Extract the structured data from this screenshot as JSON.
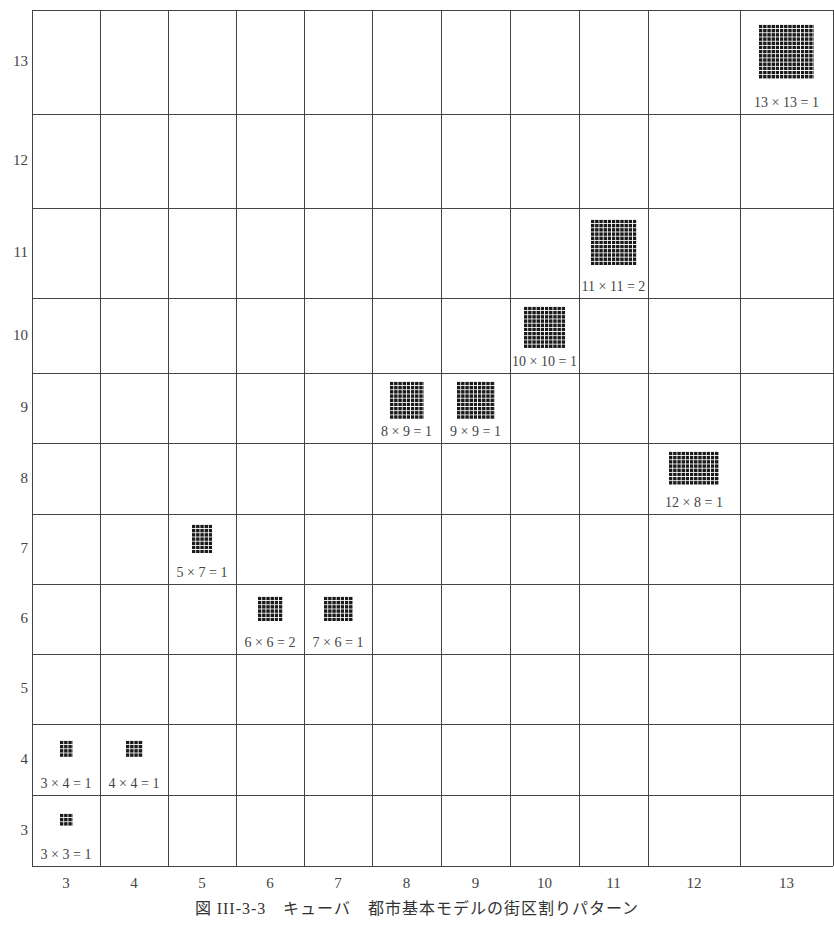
{
  "caption": "図 III-3-3　キューバ　都市基本モデルの街区割りパターン",
  "chart_data": {
    "type": "table",
    "title": "図 III-3-3　キューバ　都市基本モデルの街区割りパターン",
    "x_axis_labels": [
      "3",
      "4",
      "5",
      "6",
      "7",
      "8",
      "9",
      "10",
      "11",
      "12",
      "13"
    ],
    "y_axis_labels": [
      "13",
      "12",
      "11",
      "10",
      "9",
      "8",
      "7",
      "6",
      "5",
      "4",
      "3"
    ],
    "grid": true,
    "cells": [
      {
        "x": 3,
        "y": 3,
        "label": "3×3=1",
        "cols": 3,
        "rows": 3
      },
      {
        "x": 3,
        "y": 4,
        "label": "3×4=1",
        "cols": 3,
        "rows": 4
      },
      {
        "x": 4,
        "y": 4,
        "label": "4×4=1",
        "cols": 4,
        "rows": 4
      },
      {
        "x": 5,
        "y": 7,
        "label": "5×7=1",
        "cols": 5,
        "rows": 7
      },
      {
        "x": 6,
        "y": 6,
        "label": "6×6=2",
        "cols": 6,
        "rows": 6
      },
      {
        "x": 7,
        "y": 6,
        "label": "7×6=1",
        "cols": 7,
        "rows": 6
      },
      {
        "x": 8,
        "y": 9,
        "label": "8×9=1",
        "cols": 8,
        "rows": 9
      },
      {
        "x": 9,
        "y": 9,
        "label": "9×9=1",
        "cols": 9,
        "rows": 9
      },
      {
        "x": 10,
        "y": 10,
        "label": "10×10=1",
        "cols": 10,
        "rows": 10
      },
      {
        "x": 11,
        "y": 11,
        "label": "11×11=2",
        "cols": 11,
        "rows": 11
      },
      {
        "x": 12,
        "y": 8,
        "label": "12×8=1",
        "cols": 12,
        "rows": 8
      },
      {
        "x": 13,
        "y": 13,
        "label": "13×13=1",
        "cols": 13,
        "rows": 13
      }
    ]
  },
  "colors": {
    "grid_line": "#444444",
    "block_fill": "#1a1a1a",
    "text": "#444444"
  }
}
